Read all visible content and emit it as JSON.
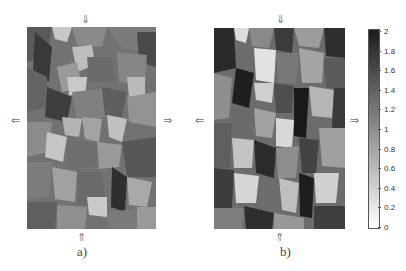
{
  "figure": {
    "panels": [
      {
        "id": "a",
        "label": "a)",
        "description": "grayscale grain microstructure map, tension test"
      },
      {
        "id": "b",
        "label": "b)",
        "description": "grayscale grain microstructure map, higher contrast"
      }
    ],
    "arrows": {
      "down": "⇓",
      "up": "⇑",
      "left": "⇐",
      "right": "⇒"
    },
    "colorbar": {
      "min": 0,
      "max": 2,
      "ticks": [
        "2",
        "1.8",
        "1.6",
        "1.4",
        "1.2",
        "1",
        "0.8",
        "0.6",
        "0.4",
        "0.2",
        "0"
      ],
      "color_low": "#ffffff",
      "color_high": "#1c1c1c"
    }
  },
  "chart_data": {
    "type": "heatmap",
    "title": "",
    "panels": [
      "a)",
      "b)"
    ],
    "colorbar_range": [
      0,
      2
    ],
    "colorbar_ticks": [
      0,
      0.2,
      0.4,
      0.6,
      0.8,
      1,
      1.2,
      1.4,
      1.6,
      1.8,
      2
    ],
    "colormap": "grayscale (white=0, black=2)",
    "annotations": [
      "⇓ top load arrow",
      "⇑ bottom load arrow",
      "⇐ left arrow",
      "⇒ right arrow"
    ]
  }
}
